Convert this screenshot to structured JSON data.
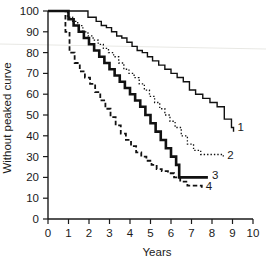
{
  "chart_data": {
    "type": "line",
    "title": "",
    "subtitle": "",
    "xlabel": "Years",
    "ylabel": "Without peaked curve",
    "xlim": [
      0,
      10
    ],
    "ylim": [
      0,
      100
    ],
    "xticks": [
      0,
      1,
      2,
      3,
      4,
      5,
      6,
      7,
      8,
      9,
      10
    ],
    "xticklabels": [
      "0",
      "1",
      "2",
      "3",
      "4",
      "5",
      "6",
      "7",
      "8",
      "9",
      "10"
    ],
    "yticks": [
      0,
      10,
      20,
      30,
      40,
      50,
      60,
      70,
      80,
      90,
      100
    ],
    "yticklabels": [
      "0",
      "10",
      "20",
      "30",
      "40",
      "50",
      "60",
      "70",
      "80",
      "90",
      "100"
    ],
    "grid": false,
    "legend_position": "curve-end-labels",
    "step_style": "post",
    "series": [
      {
        "name": "1",
        "label": "1",
        "linestyle": "solid-thin",
        "color": "#111111",
        "linewidth": 1.4,
        "end_label_value": "1",
        "x": [
          0.0,
          0.55,
          1.7,
          1.95,
          2.35,
          2.6,
          2.85,
          3.1,
          3.35,
          3.6,
          3.85,
          4.1,
          4.35,
          4.6,
          4.85,
          5.1,
          5.4,
          5.7,
          6.0,
          6.3,
          6.6,
          6.9,
          7.2,
          7.55,
          7.9,
          8.25,
          8.6,
          8.95,
          9.05
        ],
        "y": [
          100,
          100,
          100,
          97,
          95,
          93,
          92,
          90,
          88,
          87,
          85,
          83,
          81,
          80,
          78,
          76,
          74,
          72,
          70,
          68,
          66,
          62,
          60,
          58,
          56,
          54,
          48,
          44,
          42
        ]
      },
      {
        "name": "2",
        "label": "2",
        "linestyle": "dotted",
        "color": "#111111",
        "linewidth": 1.3,
        "end_label_value": "2",
        "x": [
          0.0,
          0.6,
          0.95,
          1.2,
          1.45,
          1.7,
          1.95,
          2.2,
          2.45,
          2.7,
          2.95,
          3.2,
          3.45,
          3.7,
          3.95,
          4.2,
          4.45,
          4.7,
          4.95,
          5.2,
          5.45,
          5.7,
          5.95,
          6.2,
          6.5,
          6.8,
          7.1,
          7.45,
          8.55
        ],
        "y": [
          100,
          100,
          97,
          95,
          93,
          90,
          88,
          86,
          84,
          82,
          80,
          78,
          75,
          72,
          70,
          68,
          65,
          62,
          59,
          56,
          53,
          50,
          47,
          44,
          40,
          36,
          33,
          31,
          30
        ]
      },
      {
        "name": "3",
        "label": "3",
        "linestyle": "solid-thick",
        "color": "#111111",
        "linewidth": 2.6,
        "end_label_value": "3",
        "x": [
          0.0,
          0.5,
          1.0,
          1.25,
          1.5,
          1.75,
          2.0,
          2.25,
          2.5,
          2.75,
          3.0,
          3.25,
          3.5,
          3.75,
          4.0,
          4.25,
          4.5,
          4.75,
          5.0,
          5.25,
          5.5,
          5.75,
          6.0,
          6.25,
          6.4,
          7.8
        ],
        "y": [
          100,
          100,
          96,
          93,
          90,
          87,
          84,
          81,
          78,
          75,
          72,
          69,
          66,
          63,
          60,
          57,
          54,
          50,
          46,
          42,
          38,
          34,
          30,
          26,
          20,
          20
        ]
      },
      {
        "name": "4",
        "label": "4",
        "linestyle": "dashed",
        "color": "#111111",
        "linewidth": 1.8,
        "end_label_value": "4",
        "x": [
          0.0,
          0.55,
          0.85,
          1.05,
          1.3,
          1.55,
          1.8,
          2.05,
          2.3,
          2.55,
          2.8,
          3.05,
          3.3,
          3.55,
          3.8,
          4.05,
          4.3,
          4.55,
          4.8,
          5.05,
          5.3,
          5.55,
          5.85,
          6.15,
          6.45,
          6.8,
          7.5
        ],
        "y": [
          100,
          100,
          90,
          80,
          75,
          71,
          68,
          65,
          61,
          57,
          53,
          49,
          45,
          41,
          38,
          35,
          32,
          30,
          28,
          26,
          24,
          23,
          22,
          20,
          18,
          16,
          15
        ]
      }
    ],
    "annotations": [
      {
        "text": "1",
        "x": 9.2,
        "y": 44
      },
      {
        "text": "2",
        "x": 8.7,
        "y": 31
      },
      {
        "text": "3",
        "x": 7.95,
        "y": 21
      },
      {
        "text": "4",
        "x": 7.65,
        "y": 16
      }
    ]
  }
}
